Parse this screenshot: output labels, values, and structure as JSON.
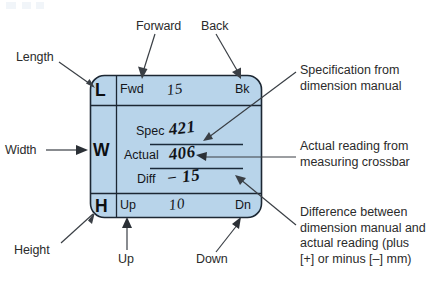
{
  "figure": {
    "title_area_watermark": "",
    "panel": {
      "fill_color": "#b8d4ea",
      "border_color": "#1c2733"
    },
    "cells": {
      "length_letter": "L",
      "width_letter": "W",
      "height_letter": "H",
      "forward_abbr": "Fwd",
      "back_abbr": "Bk",
      "up_abbr": "Up",
      "down_abbr": "Dn",
      "spec_label": "Spec",
      "actual_label": "Actual",
      "diff_label": "Diff"
    },
    "handwritten": {
      "length_value": "15",
      "spec_value": "421",
      "actual_value": "406",
      "diff_value": "− 15",
      "height_value": "10"
    },
    "callouts": {
      "length": "Length",
      "width": "Width",
      "height": "Height",
      "forward": "Forward",
      "back": "Back",
      "up": "Up",
      "down": "Down"
    },
    "annotations": {
      "spec": [
        "Specification from",
        "dimension manual"
      ],
      "actual": [
        "Actual reading from",
        "measuring crossbar"
      ],
      "diff": [
        "Difference between",
        "dimension manual and",
        "actual reading (plus",
        "[+] or minus [–] mm)"
      ]
    }
  }
}
